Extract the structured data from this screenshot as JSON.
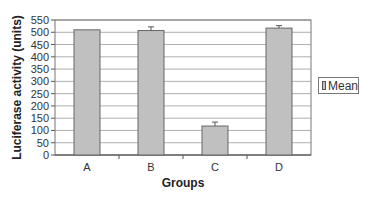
{
  "chart_data": {
    "type": "bar",
    "title": "",
    "xlabel": "Groups",
    "ylabel": "Luciferase activity (units)",
    "categories": [
      "A",
      "B",
      "C",
      "D"
    ],
    "series": [
      {
        "name": "Mean",
        "values": [
          510,
          507,
          118,
          517
        ],
        "errors": [
          0,
          15,
          16,
          10
        ],
        "color": "#c0c0c0"
      }
    ],
    "ylim": [
      0,
      550
    ],
    "yticks": [
      0,
      50,
      100,
      150,
      200,
      250,
      300,
      350,
      400,
      450,
      500,
      550
    ],
    "grid": true,
    "legend_position": "right"
  },
  "legend": {
    "label": "Mean"
  }
}
